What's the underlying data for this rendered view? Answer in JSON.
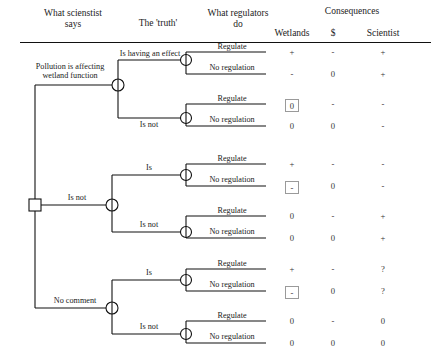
{
  "figure": {
    "caption": ""
  },
  "headers": {
    "col_scientist_says": "What scienstist\nsays",
    "col_scientist_says_l1": "What scienstist",
    "col_scientist_says_l2": "says",
    "col_truth": "The 'truth'",
    "col_regulators_l1": "What regulators",
    "col_regulators_l2": "do",
    "consequences_group": "Consequences",
    "col_wetlands": "Wetlands",
    "col_money": "$",
    "col_scientist": "Scientist"
  },
  "labels": {
    "regulate": "Regulate",
    "no_regulation": "No regulation",
    "is_having_an_effect": "Is having an effect",
    "is_not": "Is not",
    "is": "Is",
    "pollution_affecting_l1": "Pollution is affecting",
    "pollution_affecting_l2": "wetland function",
    "no_comment": "No comment"
  },
  "branches": [
    {
      "id": "says-pollution-affecting",
      "say_label_l1": "Pollution is affecting",
      "say_label_l2": "wetland function",
      "truths": [
        {
          "id": "truth-is-having-an-effect",
          "truth_label": "Is having an effect",
          "leaves": [
            {
              "action": "Regulate",
              "wetlands": "+",
              "money": "-",
              "scientist": "+",
              "wetlands_boxed": false
            },
            {
              "action": "No regulation",
              "wetlands": "-",
              "money": "0",
              "scientist": "+",
              "wetlands_boxed": false
            }
          ]
        },
        {
          "id": "truth-is-not",
          "truth_label": "Is not",
          "leaves": [
            {
              "action": "Regulate",
              "wetlands": "0",
              "money": "-",
              "scientist": "-",
              "wetlands_boxed": true
            },
            {
              "action": "No regulation",
              "wetlands": "0",
              "money": "0",
              "scientist": "-",
              "wetlands_boxed": false
            }
          ]
        }
      ]
    },
    {
      "id": "says-is-not",
      "say_label_l1": "Is not",
      "say_label_l2": "",
      "truths": [
        {
          "id": "truth-is",
          "truth_label": "Is",
          "leaves": [
            {
              "action": "Regulate",
              "wetlands": "+",
              "money": "-",
              "scientist": "-",
              "wetlands_boxed": false
            },
            {
              "action": "No regulation",
              "wetlands": "-",
              "money": "0",
              "scientist": "-",
              "wetlands_boxed": true
            }
          ]
        },
        {
          "id": "truth-is-not",
          "truth_label": "Is not",
          "leaves": [
            {
              "action": "Regulate",
              "wetlands": "0",
              "money": "-",
              "scientist": "+",
              "wetlands_boxed": false
            },
            {
              "action": "No regulation",
              "wetlands": "0",
              "money": "0",
              "scientist": "+",
              "wetlands_boxed": false
            }
          ]
        }
      ]
    },
    {
      "id": "says-no-comment",
      "say_label_l1": "No comment",
      "say_label_l2": "",
      "truths": [
        {
          "id": "truth-is",
          "truth_label": "Is",
          "leaves": [
            {
              "action": "Regulate",
              "wetlands": "+",
              "money": "-",
              "scientist": "?",
              "wetlands_boxed": false
            },
            {
              "action": "No regulation",
              "wetlands": "-",
              "money": "0",
              "scientist": "?",
              "wetlands_boxed": true
            }
          ]
        },
        {
          "id": "truth-is-not",
          "truth_label": "Is not",
          "leaves": [
            {
              "action": "Regulate",
              "wetlands": "0",
              "money": "-",
              "scientist": "0",
              "wetlands_boxed": false
            },
            {
              "action": "No regulation",
              "wetlands": "0",
              "money": "0",
              "scientist": "0",
              "wetlands_boxed": false
            }
          ]
        }
      ]
    }
  ],
  "colors": {
    "line": "#111111",
    "text": "#1a1a1a",
    "box_border": "#9a9a9a",
    "background": "#ffffff"
  }
}
